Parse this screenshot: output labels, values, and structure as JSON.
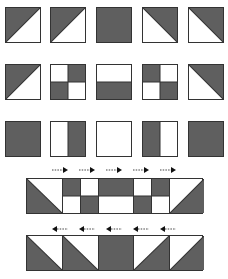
{
  "colors": {
    "dark": "#5f5f5f",
    "light": "#ffffff",
    "border": "#333333"
  },
  "grid": {
    "columns_x": [
      5,
      50,
      96,
      142,
      188
    ],
    "rows_y": [
      7,
      64,
      121
    ],
    "tile_size": 36,
    "rows": [
      {
        "tiles": [
          "tri-dark-top-left",
          "tri-dark-top-left",
          "solid-dark",
          "tri-dark-top-right",
          "tri-dark-top-right"
        ]
      },
      {
        "tiles": [
          "tri-dark-top-left",
          "quad-tr-bl-dark",
          "half-dark-bottom",
          "quad-tl-br-dark",
          "tri-dark-top-right"
        ]
      },
      {
        "tiles": [
          "solid-dark",
          "half-dark-right",
          "solid-light",
          "half-dark-left",
          "solid-dark"
        ]
      }
    ]
  },
  "strip_top": {
    "x": 26,
    "y": 178,
    "width": 177,
    "height": 36,
    "arrow_direction": "right",
    "arrows_x": [
      52,
      79,
      106,
      133,
      160
    ],
    "arrows_y": 167,
    "cells": [
      {
        "x": 0,
        "w": 35,
        "pattern": "tri-dark-bottom-left"
      },
      {
        "x": 35,
        "w": 18,
        "pattern": "dark-top"
      },
      {
        "x": 53,
        "w": 18,
        "pattern": "dark-bottom"
      },
      {
        "x": 71,
        "w": 35,
        "pattern": "dark-top"
      },
      {
        "x": 106,
        "w": 18,
        "pattern": "dark-bottom"
      },
      {
        "x": 124,
        "w": 18,
        "pattern": "dark-top"
      },
      {
        "x": 142,
        "w": 35,
        "pattern": "tri-dark-bottom-right"
      }
    ]
  },
  "strip_bottom": {
    "x": 26,
    "y": 235,
    "width": 177,
    "height": 36,
    "arrow_direction": "left",
    "arrows_x": [
      52,
      79,
      106,
      133,
      160
    ],
    "arrows_y": 226,
    "cells": [
      {
        "x": 0,
        "w": 35,
        "pattern": "tri-dark-bottom-left"
      },
      {
        "x": 35,
        "w": 36,
        "pattern": "tri-dark-bottom-left"
      },
      {
        "x": 71,
        "w": 35,
        "pattern": "solid-dark"
      },
      {
        "x": 106,
        "w": 36,
        "pattern": "tri-dark-bottom-right"
      },
      {
        "x": 142,
        "w": 35,
        "pattern": "tri-dark-bottom-right"
      }
    ]
  }
}
